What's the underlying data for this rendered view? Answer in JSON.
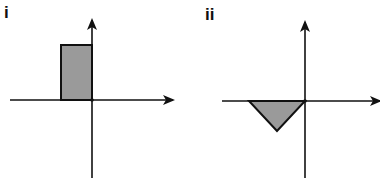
{
  "panels": [
    {
      "label": "i",
      "shape": "rectangle",
      "description": "Shaded rectangle in second quadrant, right edge on vertical axis, bottom edge on horizontal axis",
      "fill": "#9a9a9a",
      "stroke": "#111111"
    },
    {
      "label": "ii",
      "shape": "triangle",
      "description": "Shaded inverted triangle below horizontal axis, left of vertical axis, one vertex at origin",
      "fill": "#9a9a9a",
      "stroke": "#111111"
    }
  ]
}
